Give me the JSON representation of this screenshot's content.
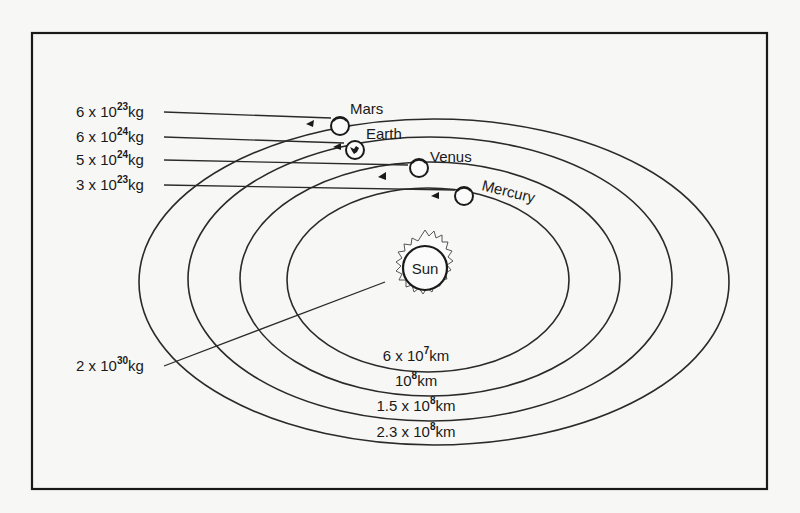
{
  "figure": {
    "type": "solar-system-diagram",
    "frame": {
      "x": 32,
      "y": 33,
      "width": 735,
      "height": 456
    }
  },
  "sun": {
    "name": "Sun",
    "mass_label": {
      "mantissa": "2 x 10",
      "exponent": "30",
      "unit": "kg"
    }
  },
  "planets": [
    {
      "name": "Mars",
      "mass_label": {
        "mantissa": "6 x 10",
        "exponent": "23",
        "unit": "kg"
      },
      "orbit_label": {
        "mantissa": "2.3 x 10",
        "exponent": "8",
        "unit": "km"
      }
    },
    {
      "name": "Earth",
      "mass_label": {
        "mantissa": "6 x 10",
        "exponent": "24",
        "unit": "kg"
      },
      "orbit_label": {
        "mantissa": "1.5 x 10",
        "exponent": "8",
        "unit": "km"
      }
    },
    {
      "name": "Venus",
      "mass_label": {
        "mantissa": "5 x 10",
        "exponent": "24",
        "unit": "kg"
      },
      "orbit_label": {
        "mantissa": "10",
        "exponent": "8",
        "unit": "km"
      }
    },
    {
      "name": "Mercury",
      "mass_label": {
        "mantissa": "3 x 10",
        "exponent": "23",
        "unit": "kg"
      },
      "orbit_label": {
        "mantissa": "6 x 10",
        "exponent": "7",
        "unit": "km"
      }
    }
  ],
  "colors": {
    "ink": "#1a1a1a",
    "paper": "#f7f7f5"
  }
}
